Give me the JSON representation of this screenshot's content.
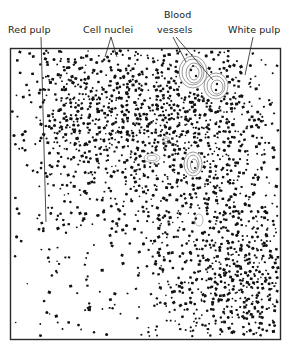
{
  "figure": {
    "labels": [
      {
        "id": "red-pulp",
        "text": "Red pulp",
        "x": 8,
        "y": 29
      },
      {
        "id": "cell-nuclei",
        "text": "Cell nuclei",
        "x": 83,
        "y": 29
      },
      {
        "id": "blood-vessels-line1",
        "text": "Blood",
        "x": 163,
        "y": 13
      },
      {
        "id": "blood-vessels-line2",
        "text": "vessels",
        "x": 157,
        "y": 29
      },
      {
        "id": "white-pulp",
        "text": "White pulp",
        "x": 228,
        "y": 29
      }
    ],
    "frame": {
      "x": 10,
      "y": 48,
      "width": 270,
      "height": 291,
      "stroke": "#2a2a2a"
    },
    "ink_color": "#111111",
    "vessel_color": "#444444"
  }
}
